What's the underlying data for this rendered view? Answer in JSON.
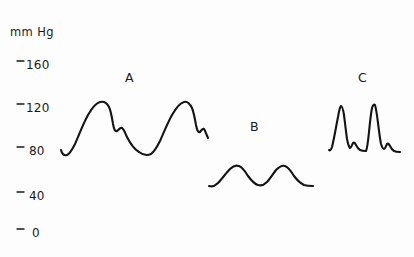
{
  "figure": {
    "background_color": "#fdfdfd",
    "ink_color": "#141414",
    "axis_unit_label": "mm Hg"
  },
  "axis": {
    "unit": "mm Hg",
    "tick_mark_glyph": "-",
    "ticks": [
      {
        "label": "160",
        "value": 160,
        "y": 65
      },
      {
        "label": "120",
        "value": 120,
        "y": 108
      },
      {
        "label": "80",
        "value": 80,
        "y": 151
      },
      {
        "label": "40",
        "value": 40,
        "y": 196
      },
      {
        "label": "0",
        "value": 0,
        "y": 233
      }
    ]
  },
  "traces": [
    {
      "letter": "A",
      "label_x": 125,
      "label_y": 82,
      "description": "normal arterial pulse with dicrotic notch",
      "systolic_peak": 125,
      "diastolic_trough": 78,
      "beats": 2,
      "path": "M 61 150 C 62 154, 64 156, 67 155 C 70 154, 72 150, 75 144 C 79 135, 83 124, 88 115 C 92 108, 96 103, 100 102 C 104 101, 107 103, 109 107 C 111 111, 112 118, 113 124 C 114 129, 115 132, 117 131 C 119 130, 120 127, 122 128 C 124 129, 125 133, 127 137 C 130 143, 134 149, 139 152 C 143 155, 147 156, 151 154 C 154 152, 157 147, 160 141 C 164 132, 168 122, 172 115 C 176 108, 180 103, 184 102 C 187 101, 190 104, 192 108 C 194 113, 195 119, 196 125 C 197 130, 198 133, 200 132 C 201 131, 202 128, 204 129 C 205 130, 206 134, 208 138"
    },
    {
      "letter": "B",
      "label_x": 250,
      "label_y": 131,
      "description": "damped low-amplitude pulse, blunted contour",
      "systolic_peak": 58,
      "diastolic_trough": 40,
      "beats": 2,
      "path": "M 209 186 C 212 187, 215 186, 218 183 C 222 179, 226 173, 230 169 C 233 166, 236 165, 239 166 C 242 167, 245 171, 248 176 C 251 180, 254 184, 258 185 C 261 186, 264 185, 267 182 C 270 179, 273 174, 276 170 C 279 167, 282 165, 285 166 C 288 167, 291 171, 294 176 C 297 180, 300 183, 304 185 C 307 186, 310 186, 313 186"
    },
    {
      "letter": "C",
      "label_x": 358,
      "label_y": 82,
      "description": "narrow spiked pulse with steep upstroke and sharp decline",
      "systolic_peak": 140,
      "diastolic_trough": 82,
      "beats": 2,
      "path": "M 329 150 C 330 151, 331 150, 332 147 C 334 139, 336 127, 338 117 C 339 111, 340 107, 341 106 C 342 106, 343 109, 344 115 C 345 123, 346 132, 347 139 C 348 144, 349 147, 350 148 C 351 148, 352 145, 353 143 C 354 142, 355 143, 356 145 C 357 147, 358 149, 360 150 C 362 151, 364 151, 366 151 C 367 149, 368 142, 369 132 C 370 122, 371 113, 372 108 C 373 105, 374 104, 375 105 C 376 108, 377 115, 378 123 C 379 131, 380 139, 381 144 C 382 147, 383 149, 384 149 C 385 149, 386 146, 387 144 C 388 143, 389 144, 390 146 C 391 148, 392 150, 394 151 C 396 152, 398 152, 400 152"
    }
  ]
}
